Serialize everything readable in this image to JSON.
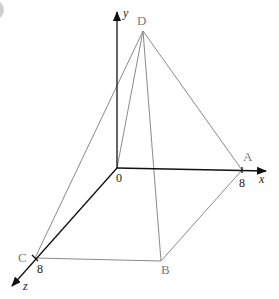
{
  "diagram": {
    "type": "3d-pyramid-on-axes",
    "axes": {
      "x": {
        "label": "x",
        "tick_label": "8"
      },
      "y": {
        "label": "y"
      },
      "z": {
        "label": "z",
        "tick_label": "8"
      },
      "origin_label": "0"
    },
    "vertices": {
      "A": {
        "label": "A"
      },
      "B": {
        "label": "B"
      },
      "C": {
        "label": "C"
      },
      "D": {
        "label": "D"
      }
    },
    "colors": {
      "edges": "#8a8a8a",
      "axes": "#111111",
      "labels": "#7a7a7a"
    }
  }
}
